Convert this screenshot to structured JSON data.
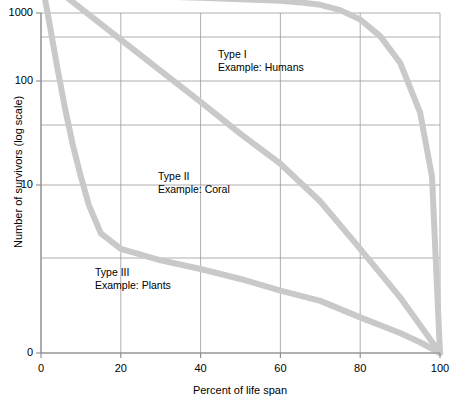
{
  "chart_data": {
    "type": "line",
    "title": "",
    "xlabel": "Percent of life span",
    "ylabel": "Number of survivors (log scale)",
    "xlim": [
      0,
      100
    ],
    "ylim": [
      0,
      1000
    ],
    "yscale": "log",
    "grid": true,
    "legend": "none",
    "xticks": [
      {
        "value": 0,
        "label": "0"
      },
      {
        "value": 20,
        "label": "20"
      },
      {
        "value": 40,
        "label": "40"
      },
      {
        "value": 60,
        "label": "60"
      },
      {
        "value": 80,
        "label": "80"
      },
      {
        "value": 100,
        "label": "100"
      }
    ],
    "yticks": [
      {
        "value": 1000,
        "label": "1000"
      },
      {
        "value": 100,
        "label": "100"
      },
      {
        "value": 10,
        "label": "10"
      },
      {
        "value": 0,
        "label": "0"
      }
    ],
    "yminor_gridlines": [
      300,
      30,
      3
    ],
    "curve_color": "#c9c9c9",
    "grid_color": "#9a9a9a",
    "axis_color": "#8a8a8a",
    "series": [
      {
        "name": "Type I",
        "annotation": {
          "line1": "Type I",
          "line2": "Example: Humans"
        },
        "x": [
          0,
          5,
          10,
          20,
          30,
          40,
          50,
          60,
          65,
          70,
          75,
          80,
          85,
          90,
          95,
          98,
          100
        ],
        "y": [
          1000,
          800,
          720,
          680,
          650,
          630,
          610,
          590,
          570,
          540,
          480,
          390,
          270,
          150,
          50,
          12,
          0.9
        ]
      },
      {
        "name": "Type II",
        "annotation": {
          "line1": "Type II",
          "line2": "Example: Coral"
        },
        "x": [
          0,
          10,
          20,
          30,
          40,
          50,
          60,
          70,
          80,
          90,
          100
        ],
        "y": [
          1000,
          500,
          250,
          125,
          63,
          31,
          16,
          7.9,
          4.0,
          2.0,
          0.9
        ]
      },
      {
        "name": "Type III",
        "annotation": {
          "line1": "Type III",
          "line2": "Example: Plants"
        },
        "x": [
          0,
          2,
          4,
          6,
          8,
          10,
          12,
          15,
          20,
          30,
          40,
          50,
          60,
          70,
          80,
          90,
          95,
          100
        ],
        "y": [
          1000,
          380,
          140,
          55,
          24,
          12,
          7.5,
          5.0,
          4.0,
          3.4,
          3.0,
          2.6,
          2.2,
          1.9,
          1.5,
          1.2,
          1.05,
          0.9
        ]
      }
    ],
    "annotations": [
      {
        "line1": "Type I",
        "line2": "Example: Humans"
      },
      {
        "line1": "Type II",
        "line2": "Example: Coral"
      },
      {
        "line1": "Type III",
        "line2": "Example: Plants"
      }
    ]
  }
}
